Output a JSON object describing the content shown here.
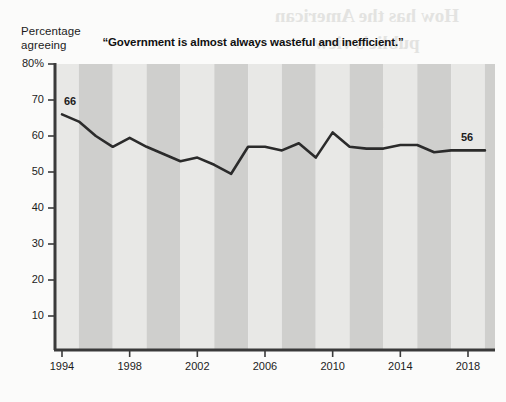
{
  "figure": {
    "background_color": "#fbfbfa",
    "bleed_through_text": "How has the American\npublic's view",
    "bleed_through_subtext": "Trust in government",
    "axis_caption_line1": "Percentage",
    "axis_caption_line2": "agreeing"
  },
  "chart_data": {
    "type": "line",
    "title": "“Government is almost always wasteful and inefficient.”",
    "xlabel": "",
    "ylabel": "Percentage agreeing",
    "ylim": [
      0,
      80
    ],
    "xlim": [
      1994,
      2019
    ],
    "grid": false,
    "legend": null,
    "line_color": "#2b2b2b",
    "band_color_light": "#e8e8e6",
    "band_color_dark": "#cfcfcd",
    "axis_color": "#3a3a3a",
    "ytick_labels": [
      "80%",
      "70",
      "60",
      "50",
      "40",
      "30",
      "20",
      "10"
    ],
    "ytick_values": [
      80,
      70,
      60,
      50,
      40,
      30,
      20,
      10
    ],
    "xtick_labels": [
      "1994",
      "1998",
      "2002",
      "2006",
      "2010",
      "2014",
      "2018"
    ],
    "xtick_values": [
      1994,
      1998,
      2002,
      2006,
      2010,
      2014,
      2018
    ],
    "x": [
      1994,
      1995,
      1996,
      1997,
      1998,
      1999,
      2000,
      2001,
      2002,
      2003,
      2004,
      2005,
      2006,
      2007,
      2008,
      2009,
      2010,
      2011,
      2012,
      2013,
      2014,
      2015,
      2016,
      2017,
      2018,
      2019
    ],
    "values": [
      66,
      64,
      60,
      57,
      59.5,
      57,
      55,
      53,
      54,
      52,
      49.5,
      57,
      57,
      56,
      58,
      54,
      61,
      57,
      56.5,
      56.5,
      57.5,
      57.5,
      55.5,
      56,
      56,
      56
    ],
    "annotations": [
      {
        "name": "start-value",
        "x": 1994,
        "value": 66,
        "text": "66"
      },
      {
        "name": "end-value",
        "x": 2019,
        "value": 56,
        "text": "56"
      }
    ]
  }
}
